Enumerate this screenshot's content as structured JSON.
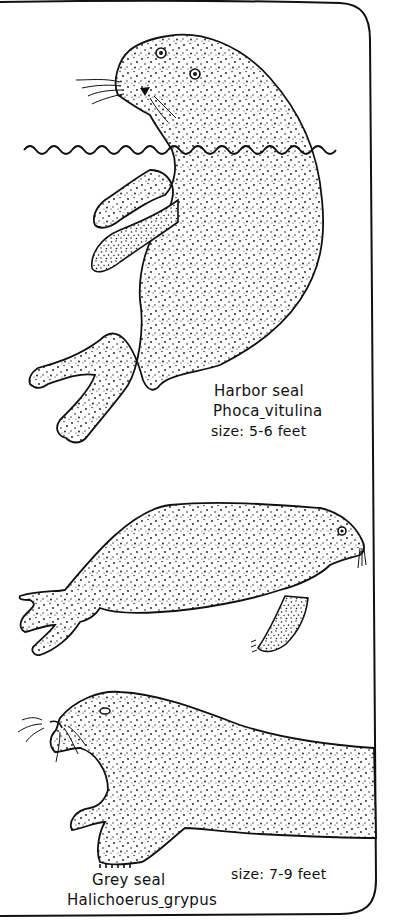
{
  "page": {
    "background": "#ffffff",
    "ink": "#111111"
  },
  "species": [
    {
      "common_name": "Harbor seal",
      "scientific_genus": "Phoca",
      "scientific_species": "vitulina",
      "size": "size: 5-6 feet"
    },
    {
      "illustration": "harbor-seal-hauled-out"
    },
    {
      "common_name": "Grey seal",
      "scientific_genus": "Halichoerus",
      "scientific_species": "grypus",
      "size": "size: 7-9 feet"
    }
  ]
}
